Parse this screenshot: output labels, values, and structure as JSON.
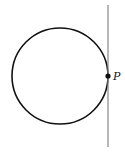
{
  "diagram": {
    "type": "circle-with-tangent",
    "circle": {
      "cx": 60,
      "cy": 76,
      "r": 48,
      "stroke": "#111111"
    },
    "tangent_line": {
      "x": 108,
      "y1": 5,
      "y2": 147,
      "stroke": "#888888"
    },
    "point": {
      "label": "P",
      "x": 108,
      "y": 76
    }
  }
}
